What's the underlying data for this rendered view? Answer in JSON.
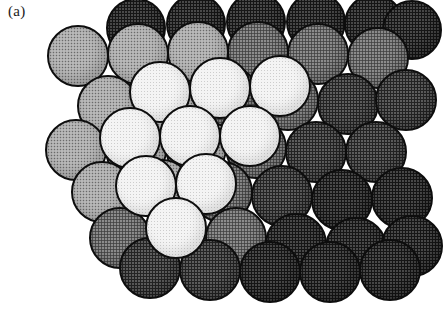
{
  "figure": {
    "label": "(a)",
    "label_x": 8,
    "label_y": 4,
    "width": 422,
    "height": 313,
    "background_color": "#ffffff",
    "outline_color": "#0d0d0d",
    "sphere_diameter": 60,
    "render_style": "halftone-dither"
  },
  "shades": {
    "white": "#f4f4f4",
    "light": "#b9b9b9",
    "medium": "#8c8c8c",
    "dark": "#5e5e5e",
    "darkest": "#4a4a4a"
  },
  "spheres": [
    {
      "cx": 196,
      "cy": 24,
      "d": 60,
      "shade": "darkest",
      "z": 1
    },
    {
      "cx": 256,
      "cy": 22,
      "d": 60,
      "shade": "darkest",
      "z": 1
    },
    {
      "cx": 316,
      "cy": 22,
      "d": 60,
      "shade": "darkest",
      "z": 1
    },
    {
      "cx": 374,
      "cy": 24,
      "d": 60,
      "shade": "darkest",
      "z": 1
    },
    {
      "cx": 136,
      "cy": 28,
      "d": 60,
      "shade": "darkest",
      "z": 1
    },
    {
      "cx": 78,
      "cy": 56,
      "d": 62,
      "shade": "light",
      "z": 4
    },
    {
      "cx": 138,
      "cy": 54,
      "d": 62,
      "shade": "light",
      "z": 4
    },
    {
      "cx": 198,
      "cy": 52,
      "d": 62,
      "shade": "light",
      "z": 4
    },
    {
      "cx": 258,
      "cy": 52,
      "d": 62,
      "shade": "medium",
      "z": 3
    },
    {
      "cx": 318,
      "cy": 54,
      "d": 62,
      "shade": "medium",
      "z": 3
    },
    {
      "cx": 378,
      "cy": 58,
      "d": 62,
      "shade": "medium",
      "z": 3
    },
    {
      "cx": 412,
      "cy": 30,
      "d": 60,
      "shade": "darkest",
      "z": 1
    },
    {
      "cx": 108,
      "cy": 106,
      "d": 62,
      "shade": "light",
      "z": 4
    },
    {
      "cx": 168,
      "cy": 104,
      "d": 62,
      "shade": "light",
      "z": 4
    },
    {
      "cx": 228,
      "cy": 96,
      "d": 62,
      "shade": "medium",
      "z": 3
    },
    {
      "cx": 288,
      "cy": 100,
      "d": 62,
      "shade": "medium",
      "z": 3
    },
    {
      "cx": 348,
      "cy": 104,
      "d": 62,
      "shade": "dark",
      "z": 3
    },
    {
      "cx": 406,
      "cy": 100,
      "d": 62,
      "shade": "dark",
      "z": 3
    },
    {
      "cx": 220,
      "cy": 88,
      "d": 62,
      "shade": "white",
      "z": 9
    },
    {
      "cx": 280,
      "cy": 86,
      "d": 62,
      "shade": "white",
      "z": 9
    },
    {
      "cx": 160,
      "cy": 92,
      "d": 62,
      "shade": "white",
      "z": 9
    },
    {
      "cx": 76,
      "cy": 150,
      "d": 62,
      "shade": "light",
      "z": 4
    },
    {
      "cx": 136,
      "cy": 150,
      "d": 62,
      "shade": "light",
      "z": 4
    },
    {
      "cx": 196,
      "cy": 148,
      "d": 62,
      "shade": "light",
      "z": 4
    },
    {
      "cx": 256,
      "cy": 148,
      "d": 62,
      "shade": "medium",
      "z": 3
    },
    {
      "cx": 316,
      "cy": 152,
      "d": 62,
      "shade": "dark",
      "z": 3
    },
    {
      "cx": 376,
      "cy": 152,
      "d": 62,
      "shade": "dark",
      "z": 3
    },
    {
      "cx": 130,
      "cy": 138,
      "d": 62,
      "shade": "white",
      "z": 10
    },
    {
      "cx": 190,
      "cy": 136,
      "d": 62,
      "shade": "white",
      "z": 10
    },
    {
      "cx": 250,
      "cy": 136,
      "d": 62,
      "shade": "white",
      "z": 10
    },
    {
      "cx": 102,
      "cy": 192,
      "d": 62,
      "shade": "light",
      "z": 5
    },
    {
      "cx": 162,
      "cy": 190,
      "d": 62,
      "shade": "light",
      "z": 5
    },
    {
      "cx": 222,
      "cy": 192,
      "d": 62,
      "shade": "medium",
      "z": 4
    },
    {
      "cx": 282,
      "cy": 196,
      "d": 62,
      "shade": "dark",
      "z": 4
    },
    {
      "cx": 342,
      "cy": 200,
      "d": 62,
      "shade": "darkest",
      "z": 4
    },
    {
      "cx": 402,
      "cy": 198,
      "d": 62,
      "shade": "darkest",
      "z": 4
    },
    {
      "cx": 146,
      "cy": 186,
      "d": 62,
      "shade": "white",
      "z": 11
    },
    {
      "cx": 206,
      "cy": 184,
      "d": 62,
      "shade": "white",
      "z": 11
    },
    {
      "cx": 176,
      "cy": 228,
      "d": 62,
      "shade": "white",
      "z": 12
    },
    {
      "cx": 120,
      "cy": 238,
      "d": 62,
      "shade": "medium",
      "z": 5
    },
    {
      "cx": 236,
      "cy": 238,
      "d": 62,
      "shade": "medium",
      "z": 5
    },
    {
      "cx": 296,
      "cy": 244,
      "d": 62,
      "shade": "darkest",
      "z": 5
    },
    {
      "cx": 356,
      "cy": 248,
      "d": 62,
      "shade": "darkest",
      "z": 5
    },
    {
      "cx": 412,
      "cy": 246,
      "d": 62,
      "shade": "darkest",
      "z": 5
    },
    {
      "cx": 150,
      "cy": 268,
      "d": 62,
      "shade": "dark",
      "z": 6
    },
    {
      "cx": 210,
      "cy": 270,
      "d": 62,
      "shade": "dark",
      "z": 6
    },
    {
      "cx": 270,
      "cy": 272,
      "d": 62,
      "shade": "darkest",
      "z": 6
    },
    {
      "cx": 330,
      "cy": 272,
      "d": 62,
      "shade": "darkest",
      "z": 6
    },
    {
      "cx": 390,
      "cy": 270,
      "d": 62,
      "shade": "darkest",
      "z": 6
    }
  ]
}
